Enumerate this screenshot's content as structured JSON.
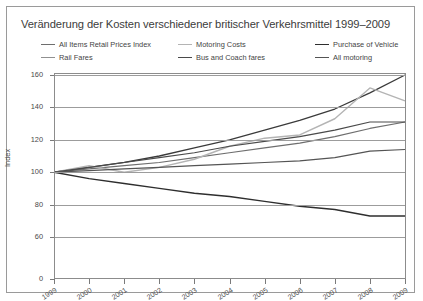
{
  "chart_data": {
    "type": "line",
    "title": "Veränderung der Kosten verschiedener britischer Verkehrsmittel 1999–2009",
    "xlabel": "",
    "ylabel": "Index",
    "x": [
      1999,
      2000,
      2001,
      2002,
      2003,
      2004,
      2005,
      2006,
      2007,
      2008,
      2009
    ],
    "xticklabels": [
      "1999",
      "2000",
      "2001",
      "2002",
      "2003",
      "2004",
      "2005",
      "2006",
      "2007",
      "2008",
      "2009"
    ],
    "yticks": [
      0,
      60,
      80,
      100,
      120,
      140,
      160
    ],
    "yticklabels": [
      "0",
      "60",
      "80",
      "100",
      "120",
      "140",
      "160"
    ],
    "ylim": [
      0,
      160
    ],
    "broken_axis": true,
    "grid": "horizontal",
    "legend_position": "top",
    "series": [
      {
        "name": "All Items Retail Prices Index",
        "color": "#6e6e6e",
        "width": 1.2,
        "values": [
          100,
          102,
          104,
          106,
          109,
          112,
          115,
          118,
          122,
          127,
          131
        ]
      },
      {
        "name": "Rail Fares",
        "color": "#3a3a3a",
        "width": 1.3,
        "values": [
          100,
          103,
          106,
          110,
          115,
          120,
          126,
          132,
          139,
          149,
          160
        ]
      },
      {
        "name": "Motoring Costs",
        "color": "#b4b4b4",
        "width": 1.4,
        "values": [
          100,
          104,
          100,
          103,
          108,
          116,
          121,
          123,
          133,
          152,
          144
        ]
      },
      {
        "name": "Bus and Coach fares",
        "color": "#4a4a4a",
        "width": 1.2,
        "values": [
          100,
          103,
          106,
          109,
          112,
          116,
          119,
          122,
          126,
          131,
          131
        ]
      },
      {
        "name": "Purchase of Vehicle",
        "color": "#2e2e2e",
        "width": 1.4,
        "values": [
          100,
          96,
          93,
          90,
          87,
          85,
          82,
          79,
          77,
          73,
          73
        ]
      },
      {
        "name": "All motoring",
        "color": "#545454",
        "width": 1.2,
        "values": [
          100,
          101,
          102,
          103,
          104,
          105,
          106,
          107,
          109,
          113,
          114
        ]
      }
    ]
  },
  "legend": {
    "columns": [
      [
        {
          "label": "All Items Retail Prices Index",
          "color": "#6e6e6e"
        },
        {
          "label": "Rail Fares",
          "color": "#909090"
        }
      ],
      [
        {
          "label": "Motoring Costs",
          "color": "#b4b4b4"
        },
        {
          "label": "Bus and Coach fares",
          "color": "#4a4a4a"
        }
      ],
      [
        {
          "label": "Purchase of Vehicle",
          "color": "#2e2e2e"
        },
        {
          "label": "All motoring",
          "color": "#545454"
        }
      ]
    ]
  }
}
